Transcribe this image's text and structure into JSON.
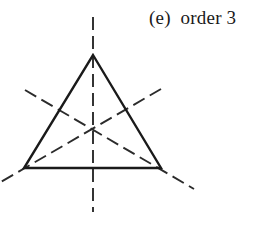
{
  "figure": {
    "caption": "(e)  order 3",
    "caption_parts": {
      "label": "(e)",
      "text": "order 3",
      "order_value": 3
    },
    "background_color": "#ffffff",
    "stroke_color": "#1a1a1a",
    "dash_color": "#2b2b2b",
    "width": 259,
    "height": 225
  },
  "chart_data": {
    "type": "diagram",
    "title": "(e)  order 3",
    "subtitle": "",
    "xlabel": "",
    "ylabel": "",
    "grid": false,
    "legend_position": "none",
    "xlim": [
      0,
      259
    ],
    "ylim": [
      0,
      225
    ],
    "shapes": [
      {
        "name": "triangle",
        "kind": "polygon",
        "style": "solid",
        "stroke_width": 2.4,
        "points": [
          [
            93,
            55
          ],
          [
            161,
            168
          ],
          [
            24,
            168
          ]
        ]
      }
    ],
    "symmetry": {
      "rotational_order": 3,
      "reflection_axes": 3,
      "center": [
        93,
        130.3
      ]
    },
    "mirror_lines": [
      {
        "name": "vertical-mirror",
        "kind": "line",
        "style": "dashed",
        "stroke_width": 1.9,
        "through_vertex": [
          93,
          55
        ],
        "points": [
          [
            93,
            17
          ],
          [
            93,
            212
          ]
        ]
      },
      {
        "name": "mirror-through-bottom-left-vertex",
        "kind": "line",
        "style": "dashed",
        "stroke_width": 1.9,
        "through_vertex": [
          24,
          168
        ],
        "points": [
          [
            25,
            90
          ],
          [
            194,
            189
          ]
        ]
      },
      {
        "name": "mirror-through-bottom-right-vertex",
        "kind": "line",
        "style": "dashed",
        "stroke_width": 1.9,
        "through_vertex": [
          161,
          168
        ],
        "points": [
          [
            161,
            89
          ],
          [
            -1,
            183
          ]
        ]
      }
    ],
    "vertices": [
      {
        "name": "apex",
        "x": 93,
        "y": 55
      },
      {
        "name": "bottom-right",
        "x": 161,
        "y": 168
      },
      {
        "name": "bottom-left",
        "x": 24,
        "y": 168
      }
    ]
  }
}
